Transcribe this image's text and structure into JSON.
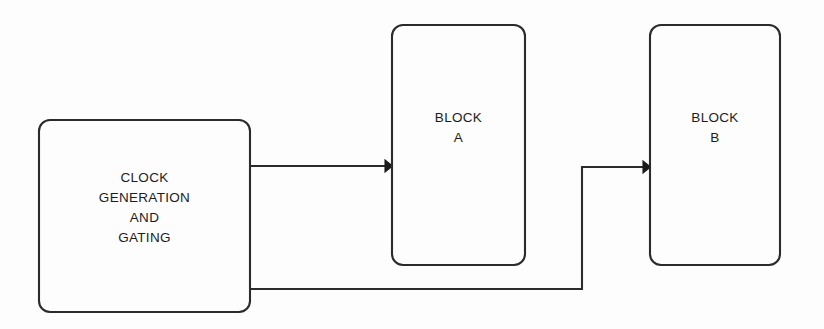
{
  "diagram": {
    "type": "block-diagram",
    "background_color": "#fdfdfd",
    "stroke_color": "#2b2b2b",
    "text_color": "#1c1c1c",
    "blocks": [
      {
        "id": "clock-generation-and-gating",
        "label": "CLOCK\nGENERATION\nAND\nGATING",
        "x": 39,
        "y": 120,
        "width": 211,
        "height": 192,
        "corner_radius": 11
      },
      {
        "id": "block-a",
        "label": "BLOCK\nA",
        "x": 392,
        "y": 25,
        "width": 133,
        "height": 240,
        "corner_radius": 11
      },
      {
        "id": "block-b",
        "label": "BLOCK\nB",
        "x": 650,
        "y": 25,
        "width": 130,
        "height": 240,
        "corner_radius": 11
      }
    ],
    "connections": [
      {
        "id": "clock-to-block-a",
        "from": "clock-generation-and-gating",
        "to": "block-a",
        "path": "M 250 166 L 385 166",
        "arrowhead": true,
        "arrow_tip_x": 392,
        "arrow_tip_y": 166
      },
      {
        "id": "clock-to-block-b",
        "from": "clock-generation-and-gating",
        "to": "block-b",
        "path": "M 250 289 L 582 289 L 582 167 L 643 167",
        "arrowhead": true,
        "arrow_tip_x": 650,
        "arrow_tip_y": 167
      }
    ]
  }
}
